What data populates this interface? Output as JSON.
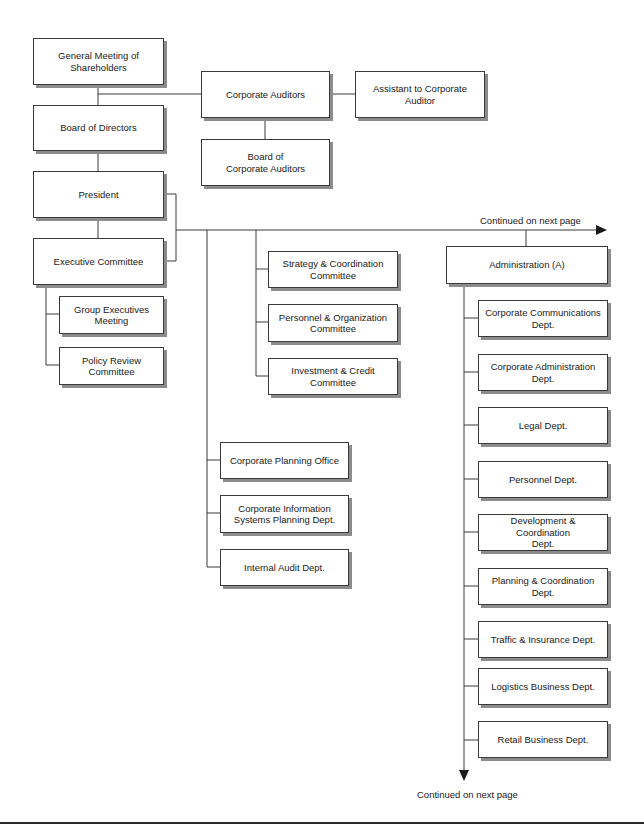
{
  "chart_title": "",
  "nodes": {
    "general_meeting": "General Meeting of\nShareholders",
    "corporate_auditors": "Corporate Auditors",
    "assistant_auditor": "Assistant to Corporate\nAuditor",
    "board_corporate_auditors": "Board of\nCorporate Auditors",
    "board_directors": "Board of Directors",
    "president": "President",
    "executive_committee": "Executive Committee",
    "group_executives": "Group Executives\nMeeting",
    "policy_review": "Policy Review\nCommittee",
    "strategy_committee": "Strategy & Coordination\nCommittee",
    "personnel_committee": "Personnel & Organization\nCommittee",
    "investment_committee": "Investment & Credit\nCommittee",
    "corporate_planning": "Corporate Planning Office",
    "corporate_info_systems": "Corporate Information\nSystems Planning Dept.",
    "internal_audit": "Internal Audit Dept.",
    "administration": "Administration (A)"
  },
  "administration_depts": [
    "Corporate Communications\nDept.",
    "Corporate Administration\nDept.",
    "Legal Dept.",
    "Personnel Dept.",
    "Development & Coordination\nDept.",
    "Planning & Coordination\nDept.",
    "Traffic & Insurance Dept.",
    "Logistics Business Dept.",
    "Retail Business Dept."
  ],
  "notes": {
    "continued_right": "Continued on next page",
    "continued_bottom": "Continued on next page"
  },
  "colors": {
    "line": "#3a3a3a",
    "shadow": "#8c8c8c",
    "background": "#ffffff"
  }
}
